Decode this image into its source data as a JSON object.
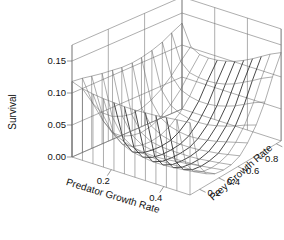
{
  "chart_data": {
    "type": "surface",
    "title": "",
    "xlabel": "Predator Growth Rate",
    "ylabel": "Prey Growth Rate",
    "zlabel": "Survival",
    "xticks": [
      "0.2",
      "0.4"
    ],
    "xtick_values": [
      0.2,
      0.4
    ],
    "yticks": [
      "0.2",
      "0.4",
      "0.6",
      "0.8",
      "1.0"
    ],
    "ytick_values": [
      0.2,
      0.4,
      0.6,
      0.8,
      1.0
    ],
    "zticks": [
      "0.00",
      "0.05",
      "0.10",
      "0.15"
    ],
    "ztick_values": [
      0.0,
      0.05,
      0.1,
      0.15
    ],
    "xlim": [
      0.05,
      0.5
    ],
    "ylim": [
      0.1,
      1.05
    ],
    "zlim": [
      0.0,
      0.175
    ],
    "grid": false,
    "legend": "none",
    "style": "wireframe-perspective",
    "x": [
      0.05,
      0.09,
      0.13,
      0.17,
      0.21,
      0.25,
      0.29,
      0.33,
      0.37,
      0.41,
      0.45,
      0.5
    ],
    "y": [
      0.1,
      0.19,
      0.27,
      0.36,
      0.45,
      0.53,
      0.62,
      0.7,
      0.79,
      0.88,
      0.96,
      1.05
    ],
    "z": [
      [
        0.118,
        0.116,
        0.113,
        0.11,
        0.108,
        0.106,
        0.106,
        0.108,
        0.112,
        0.118,
        0.126,
        0.134
      ],
      [
        0.112,
        0.082,
        0.061,
        0.048,
        0.041,
        0.038,
        0.04,
        0.046,
        0.056,
        0.07,
        0.086,
        0.102
      ],
      [
        0.109,
        0.06,
        0.035,
        0.022,
        0.016,
        0.014,
        0.017,
        0.024,
        0.036,
        0.053,
        0.073,
        0.094
      ],
      [
        0.107,
        0.046,
        0.022,
        0.011,
        0.006,
        0.005,
        0.008,
        0.015,
        0.028,
        0.047,
        0.07,
        0.093
      ],
      [
        0.106,
        0.038,
        0.015,
        0.006,
        0.003,
        0.002,
        0.004,
        0.011,
        0.024,
        0.044,
        0.069,
        0.094
      ],
      [
        0.105,
        0.033,
        0.012,
        0.004,
        0.001,
        0.001,
        0.003,
        0.009,
        0.023,
        0.044,
        0.07,
        0.097
      ],
      [
        0.105,
        0.031,
        0.01,
        0.003,
        0.001,
        0.001,
        0.003,
        0.01,
        0.024,
        0.046,
        0.073,
        0.101
      ],
      [
        0.106,
        0.03,
        0.01,
        0.003,
        0.001,
        0.001,
        0.004,
        0.012,
        0.027,
        0.05,
        0.078,
        0.107
      ],
      [
        0.107,
        0.031,
        0.011,
        0.004,
        0.002,
        0.002,
        0.006,
        0.015,
        0.031,
        0.055,
        0.085,
        0.114
      ],
      [
        0.109,
        0.033,
        0.013,
        0.005,
        0.003,
        0.004,
        0.008,
        0.019,
        0.036,
        0.062,
        0.092,
        0.122
      ],
      [
        0.111,
        0.035,
        0.015,
        0.007,
        0.005,
        0.006,
        0.011,
        0.023,
        0.042,
        0.069,
        0.1,
        0.13
      ],
      [
        0.113,
        0.038,
        0.018,
        0.01,
        0.008,
        0.009,
        0.015,
        0.028,
        0.048,
        0.076,
        0.108,
        0.138
      ]
    ],
    "valley_note": "deep near-zero trough running diagonally across mid predator growth rates",
    "left_wall_note": "tall plateau ridge at lowest predator growth rate, survival ~0.11"
  },
  "projection": {
    "origin_x": 72,
    "origin_y": 157,
    "x_axis_dx": 118,
    "x_axis_dy": 38,
    "y_axis_dx": 110,
    "y_axis_dy": -48,
    "z_axis_dy": -112
  }
}
